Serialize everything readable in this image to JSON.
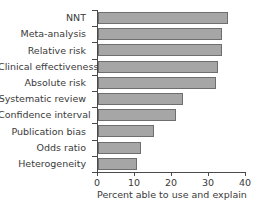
{
  "chart_data": {
    "type": "bar",
    "orientation": "horizontal",
    "title": "",
    "xlabel": "Percent able to use and explain",
    "ylabel": "",
    "xlim": [
      0,
      40
    ],
    "xticks": [
      0,
      10,
      20,
      30,
      40
    ],
    "xtick_labels": [
      "0",
      "10",
      "20",
      "30",
      "40"
    ],
    "grid": false,
    "legend": null,
    "bar_color": "#a6a6a6",
    "bar_edge_color": "#6e6e6e",
    "axis_color": "#4a4a4a",
    "categories": [
      "NNT",
      "Meta-analysis",
      "Relative risk",
      "Clinical effectiveness",
      "Absolute risk",
      "Systematic review",
      "Confidence interval",
      "Publication bias",
      "Odds ratio",
      "Heterogeneity"
    ],
    "values": [
      35,
      33.5,
      33.5,
      32.5,
      32,
      23,
      21,
      15,
      11.5,
      10.5
    ]
  }
}
